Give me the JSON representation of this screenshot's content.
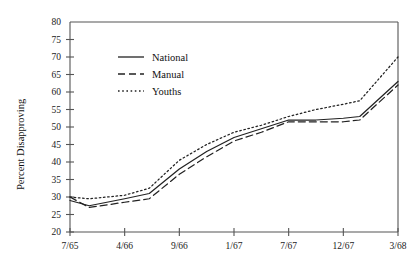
{
  "chart_data": {
    "type": "line",
    "title": "",
    "xlabel": "",
    "ylabel": "Percent Disapproving",
    "ylim": [
      20,
      80
    ],
    "yticks": [
      20,
      25,
      30,
      35,
      40,
      45,
      50,
      55,
      60,
      65,
      70,
      75,
      80
    ],
    "categories": [
      "7/65",
      "4/66",
      "9/66",
      "1/67",
      "7/67",
      "12/67",
      "3/68"
    ],
    "xticks": [
      "7/65",
      "4/66",
      "9/66",
      "1/67",
      "7/67",
      "12/67",
      "3/68"
    ],
    "grid": false,
    "legend_position": "upper-left-inside",
    "series": [
      {
        "name": "National",
        "style": "solid",
        "color": "#222222",
        "x": [
          0,
          0.35,
          1,
          1.45,
          2,
          2.5,
          3,
          3.5,
          4,
          4.5,
          5,
          5.3,
          6
        ],
        "values": [
          29,
          27.5,
          29.5,
          31,
          38,
          43,
          47,
          49.5,
          52,
          52,
          52.5,
          53,
          63
        ]
      },
      {
        "name": "Manual",
        "style": "dashed",
        "color": "#222222",
        "x": [
          0,
          0.35,
          1,
          1.45,
          2,
          2.5,
          3,
          3.5,
          4,
          4.5,
          5,
          5.3,
          6
        ],
        "values": [
          30,
          27,
          28.5,
          29.5,
          36.5,
          41.5,
          46,
          48.5,
          51.5,
          51.5,
          51.5,
          52,
          62
        ]
      },
      {
        "name": "Youths",
        "style": "dotted",
        "color": "#222222",
        "x": [
          0,
          0.35,
          1,
          1.45,
          2,
          2.5,
          3,
          3.5,
          4,
          4.5,
          5,
          5.3,
          6
        ],
        "values": [
          30,
          29.5,
          30.5,
          32.5,
          40.5,
          45,
          48.5,
          50.5,
          53,
          55,
          56.5,
          57.5,
          70
        ]
      }
    ]
  },
  "legend": {
    "items": [
      {
        "label": "National",
        "style": "solid"
      },
      {
        "label": "Manual",
        "style": "dashed"
      },
      {
        "label": "Youths",
        "style": "dotted"
      }
    ]
  }
}
